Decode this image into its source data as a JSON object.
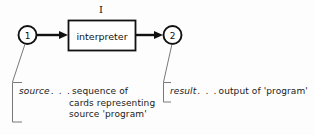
{
  "figure": {
    "title_label": "I",
    "process": {
      "label": "interpreter"
    },
    "nodes": [
      {
        "id": "node-1",
        "label": "1"
      },
      {
        "id": "node-2",
        "label": "2"
      }
    ],
    "flow": {
      "input_arrow": "arrow-right",
      "output_arrow": "arrow-right"
    },
    "annotations": {
      "source": {
        "term": "source",
        "dots": ". . .",
        "line1": "sequence of",
        "line2": "cards representing",
        "line3": "source 'program'"
      },
      "result": {
        "term": "result",
        "dots": ". . .",
        "line1": "output of 'program'"
      }
    },
    "colors": {
      "ink": "#111111",
      "background": "#fdfdfd",
      "leader": "#555555"
    }
  }
}
